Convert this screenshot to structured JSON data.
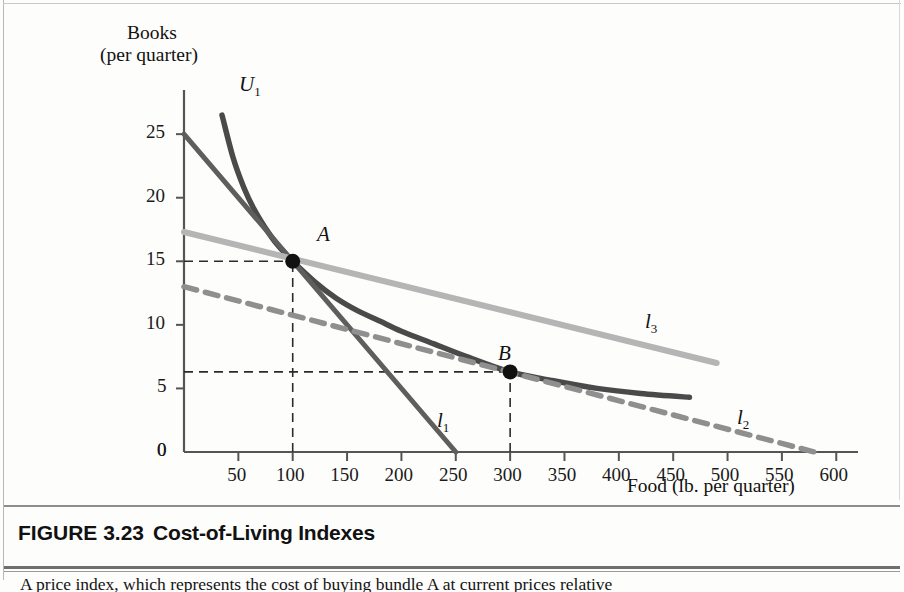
{
  "figure": {
    "number": "FIGURE 3.23",
    "title": "Cost-of-Living Indexes",
    "body_text": "A price index, which represents the cost of buying bundle A at current prices relative"
  },
  "axes": {
    "y_title_line1": "Books",
    "y_title_line2": "(per quarter)",
    "x_title": "Food (lb. per quarter)",
    "y_ticks": [
      "0",
      "5",
      "10",
      "15",
      "20",
      "25"
    ],
    "y_tick_values": [
      0,
      5,
      10,
      15,
      20,
      25
    ],
    "x_ticks": [
      "50",
      "100",
      "150",
      "200",
      "250",
      "300",
      "350",
      "400",
      "450",
      "500",
      "550",
      "600"
    ],
    "x_tick_values": [
      50,
      100,
      150,
      200,
      250,
      300,
      350,
      400,
      450,
      500,
      550,
      600
    ],
    "x_origin_label": "0",
    "xlim": [
      0,
      620
    ],
    "ylim": [
      0,
      28
    ]
  },
  "labels": {
    "u1": "U",
    "u1_sub": "1",
    "l1": "l",
    "l1_sub": "1",
    "l2": "l",
    "l2_sub": "2",
    "l3": "l",
    "l3_sub": "3",
    "point_a": "A",
    "point_b": "B"
  },
  "colors": {
    "indifference_curve": "#4a4a4a",
    "budget_l1": "#5e5e5e",
    "budget_l2": "#8f8f8f",
    "budget_l3": "#b5b5b5",
    "axis": "#555555",
    "dashed_guide": "#2b2b2b",
    "point": "#111111",
    "text": "#141414"
  },
  "chart_data": {
    "type": "line",
    "title": "Cost-of-Living Indexes",
    "xlabel": "Food (lb. per quarter)",
    "ylabel": "Books (per quarter)",
    "xlim": [
      0,
      620
    ],
    "ylim": [
      0,
      28
    ],
    "grid": false,
    "legend": "inline-labels",
    "points": [
      {
        "name": "A",
        "x": 100,
        "y": 15,
        "label": "A"
      },
      {
        "name": "B",
        "x": 300,
        "y": 6.3,
        "label": "B"
      }
    ],
    "series": [
      {
        "name": "U1",
        "kind": "indifference-curve",
        "style": "solid",
        "color": "#4a4a4a",
        "points": [
          [
            35,
            26.5
          ],
          [
            45,
            23.2
          ],
          [
            55,
            20.8
          ],
          [
            65,
            19.0
          ],
          [
            75,
            17.6
          ],
          [
            85,
            16.4
          ],
          [
            100,
            15.0
          ],
          [
            120,
            13.4
          ],
          [
            140,
            12.1
          ],
          [
            160,
            11.1
          ],
          [
            180,
            10.3
          ],
          [
            200,
            9.5
          ],
          [
            230,
            8.5
          ],
          [
            260,
            7.5
          ],
          [
            300,
            6.3
          ],
          [
            340,
            5.6
          ],
          [
            380,
            5.0
          ],
          [
            420,
            4.6
          ],
          [
            465,
            4.3
          ]
        ]
      },
      {
        "name": "l1",
        "kind": "budget-line",
        "style": "solid",
        "color": "#5e5e5e",
        "points": [
          [
            0,
            25
          ],
          [
            250,
            0
          ]
        ],
        "x_intercept": 250,
        "y_intercept": 25
      },
      {
        "name": "l2",
        "kind": "budget-line",
        "style": "dashed",
        "color": "#8f8f8f",
        "points": [
          [
            0,
            13.0
          ],
          [
            580,
            0
          ]
        ],
        "x_intercept": 580,
        "y_intercept": 13.0
      },
      {
        "name": "l3",
        "kind": "budget-line",
        "style": "solid",
        "color": "#b5b5b5",
        "points": [
          [
            0,
            17.3
          ],
          [
            490,
            7.0
          ]
        ],
        "y_intercept": 17.3
      }
    ],
    "guides": [
      {
        "from": [
          0,
          15
        ],
        "to": [
          100,
          15
        ],
        "style": "dashed"
      },
      {
        "from": [
          100,
          0
        ],
        "to": [
          100,
          15
        ],
        "style": "dashed"
      },
      {
        "from": [
          0,
          6.3
        ],
        "to": [
          300,
          6.3
        ],
        "style": "dashed"
      },
      {
        "from": [
          300,
          0
        ],
        "to": [
          300,
          6.3
        ],
        "style": "dashed"
      }
    ]
  }
}
